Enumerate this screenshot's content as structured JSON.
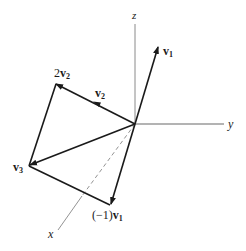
{
  "diagram": {
    "axes": {
      "x": {
        "label": "x"
      },
      "y": {
        "label": "y"
      },
      "z": {
        "label": "z"
      }
    },
    "vectors": [
      {
        "id": "v1",
        "label_base": "v",
        "label_sub": "1"
      },
      {
        "id": "v2",
        "label_base": "v",
        "label_sub": "2"
      },
      {
        "id": "2v2",
        "label_prefix": "2",
        "label_base": "v",
        "label_sub": "2"
      },
      {
        "id": "v3",
        "label_base": "v",
        "label_sub": "3"
      },
      {
        "id": "neg-v1",
        "label_prefix": "(−1)",
        "label_base": "v",
        "label_sub": "1"
      }
    ],
    "colors": {
      "axis": "#8a8a8a",
      "vector": "#1a1a1a"
    }
  }
}
